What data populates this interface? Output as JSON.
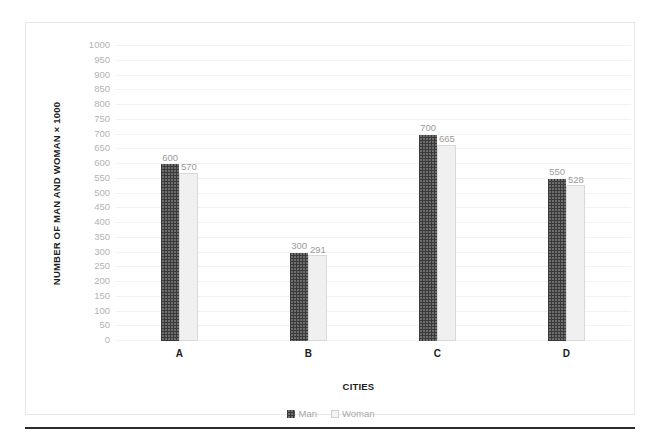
{
  "chart_data": {
    "type": "bar",
    "title": "",
    "xlabel": "CITIES",
    "ylabel": "NUMBER OF MAN AND WOMAN × 1000",
    "categories": [
      "A",
      "B",
      "C",
      "D"
    ],
    "series": [
      {
        "name": "Man",
        "values": [
          600,
          300,
          700,
          550
        ]
      },
      {
        "name": "Woman",
        "values": [
          570,
          291,
          665,
          528
        ]
      }
    ],
    "ylim": [
      0,
      1000
    ],
    "ytick_step": 50,
    "yticks": [
      0,
      50,
      100,
      150,
      200,
      250,
      300,
      350,
      400,
      450,
      500,
      550,
      600,
      650,
      700,
      750,
      800,
      850,
      900,
      950,
      1000
    ],
    "ytick_labels": [
      "0",
      "50",
      "100",
      "150",
      "200",
      "250",
      "300",
      "350",
      "400",
      "450",
      "500",
      "550",
      "600",
      "650",
      "700",
      "750",
      "800",
      "850",
      "900",
      "950",
      "1000"
    ],
    "data_labels": [
      [
        "600",
        "570"
      ],
      [
        "300",
        "291"
      ],
      [
        "700",
        "665"
      ],
      [
        "550",
        "528"
      ]
    ],
    "grid": true,
    "legend_position": "bottom",
    "colors": {
      "man": "#6e6e6e",
      "man_pattern": "#3a3a3a",
      "woman": "#f0f0f0",
      "woman_border": "#d9d9d9",
      "gridline": "#f2f2f2",
      "tick_label": "#b3b3b3",
      "data_label": "#9a9a9a",
      "axis_title": "#1c1c1c",
      "legend_label": "#a9a9a9",
      "frame_border": "#e8e8e8",
      "bottom_rule": "#2b2b2b"
    }
  },
  "legend": {
    "items": [
      {
        "label": "Man",
        "swatch": "man-swatch-icon"
      },
      {
        "label": "Woman",
        "swatch": "woman-swatch-icon"
      }
    ]
  }
}
